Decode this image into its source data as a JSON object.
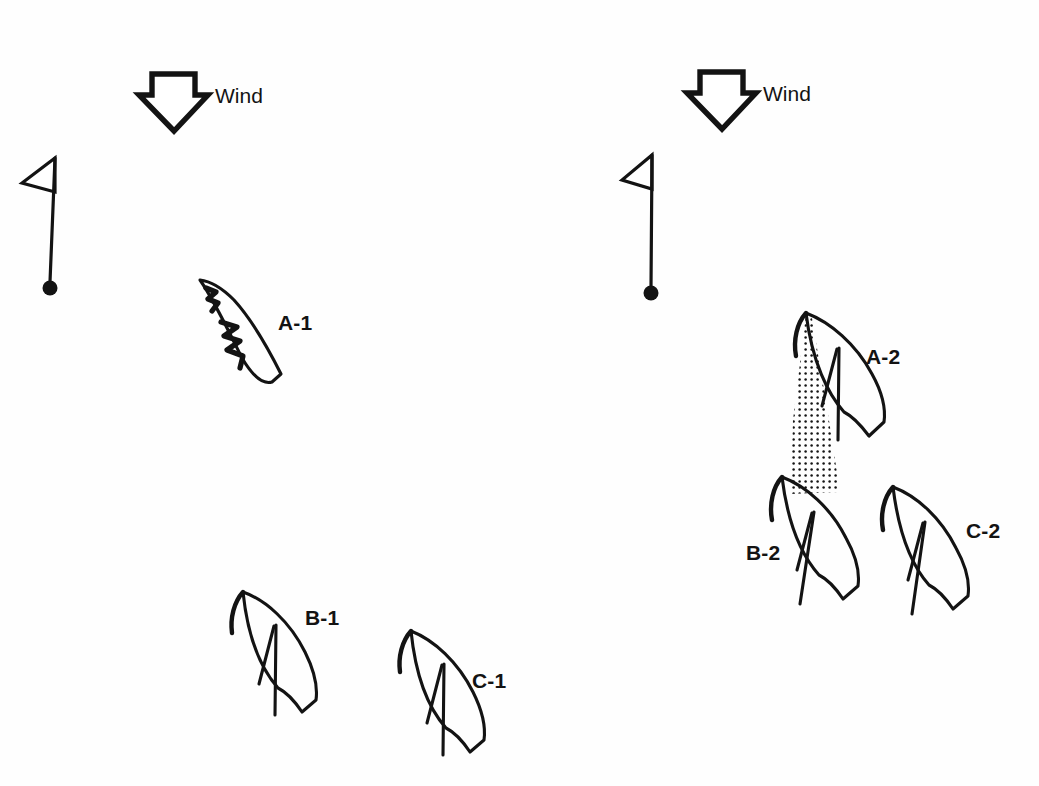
{
  "figure": {
    "kind": "sailing-tactics-diagram",
    "background_color": "#fefefe",
    "ink_color": "#131313",
    "width": 1039,
    "height": 786
  },
  "panels": [
    {
      "id": "panel-left",
      "wind": {
        "label": "Wind",
        "direction": "down",
        "arrow_x": 160,
        "arrow_y": 72,
        "label_x": 196,
        "label_y": 100
      },
      "mark": {
        "name": "race-mark-flag",
        "pole_x": 55,
        "pole_top_y": 158,
        "pole_bottom_y": 283,
        "buoy_x": 50,
        "buoy_y": 288,
        "buoy_r": 7,
        "flag_tip_x": 22,
        "flag_tip_y": 182
      },
      "boats": [
        {
          "id": "A-1",
          "label": "A-1",
          "label_x": 278,
          "label_y": 328,
          "state": "luffing",
          "bow_x": 200,
          "bow_y": 280,
          "note": "sail luffing - shown as zigzag lines"
        }
      ]
    },
    {
      "id": "panel-right",
      "wind": {
        "label": "Wind",
        "direction": "down",
        "arrow_x": 707,
        "arrow_y": 70,
        "label_x": 744,
        "label_y": 98
      },
      "mark": {
        "name": "race-mark-flag",
        "pole_x": 651,
        "pole_top_y": 155,
        "pole_bottom_y": 288,
        "buoy_x": 651,
        "buoy_y": 293,
        "buoy_r": 7,
        "flag_tip_x": 622,
        "flag_tip_y": 178
      },
      "boats": [
        {
          "id": "A-2",
          "label": "A-2",
          "label_x": 868,
          "label_y": 362,
          "state": "sailing",
          "bow_x": 806,
          "bow_y": 313
        },
        {
          "id": "B-2",
          "label": "B-2",
          "label_x": 748,
          "label_y": 558,
          "state": "sailing-in-wind-shadow",
          "bow_x": 782,
          "bow_y": 477
        },
        {
          "id": "C-2",
          "label": "C-2",
          "label_x": 968,
          "label_y": 536,
          "state": "sailing",
          "bow_x": 893,
          "bow_y": 487
        }
      ],
      "wind_shadow": {
        "name": "wind-shadow-cone",
        "pattern": "stipple-dots",
        "dot_color": "#131313",
        "dot_spacing": 6,
        "dot_radius": 1.25,
        "from_boat": "A-2",
        "to_boat": "B-2"
      }
    }
  ],
  "left_panel_extra_boats": [
    {
      "id": "B-1",
      "label": "B-1",
      "label_x": 305,
      "label_y": 623,
      "bow_x": 243,
      "bow_y": 592
    },
    {
      "id": "C-1",
      "label": "C-1",
      "label_x": 472,
      "label_y": 686,
      "bow_x": 411,
      "bow_y": 631
    }
  ],
  "labels": {
    "wind": "Wind",
    "a1": "A-1",
    "b1": "B-1",
    "c1": "C-1",
    "a2": "A-2",
    "b2": "B-2",
    "c2": "C-2"
  }
}
